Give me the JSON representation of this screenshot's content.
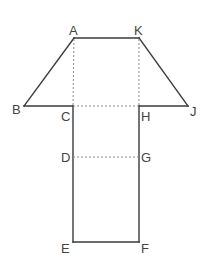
{
  "diagram": {
    "title": "",
    "colors": {
      "solid_line": "#3a3a3a",
      "dashed_line": "#8a8a8a",
      "label": "#444444",
      "background": "#ffffff"
    },
    "points": {
      "A": {
        "label": "A",
        "x": 74,
        "y": 38
      },
      "K": {
        "label": "K",
        "x": 139,
        "y": 38
      },
      "B": {
        "label": "B",
        "x": 24,
        "y": 106
      },
      "J": {
        "label": "J",
        "x": 188,
        "y": 106
      },
      "C": {
        "label": "C",
        "x": 73,
        "y": 106
      },
      "H": {
        "label": "H",
        "x": 139,
        "y": 106
      },
      "D": {
        "label": "D",
        "x": 73,
        "y": 157
      },
      "G": {
        "label": "G",
        "x": 139,
        "y": 157
      },
      "E": {
        "label": "E",
        "x": 73,
        "y": 242
      },
      "F": {
        "label": "F",
        "x": 139,
        "y": 242
      }
    },
    "solid_segments": [
      [
        "A",
        "K"
      ],
      [
        "A",
        "B"
      ],
      [
        "K",
        "J"
      ],
      [
        "B",
        "C"
      ],
      [
        "H",
        "J"
      ],
      [
        "C",
        "E"
      ],
      [
        "H",
        "F"
      ],
      [
        "E",
        "F"
      ]
    ],
    "dashed_segments": [
      [
        "A",
        "C"
      ],
      [
        "K",
        "H"
      ],
      [
        "C",
        "H"
      ],
      [
        "D",
        "G"
      ]
    ],
    "labels": {
      "A": "A",
      "K": "K",
      "B": "B",
      "J": "J",
      "C": "C",
      "H": "H",
      "D": "D",
      "G": "G",
      "E": "E",
      "F": "F"
    }
  }
}
